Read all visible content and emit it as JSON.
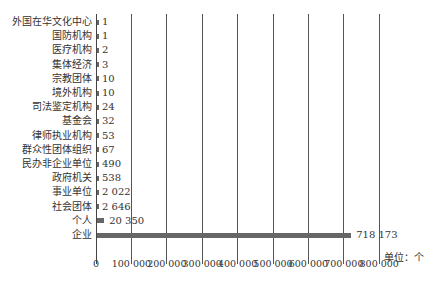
{
  "chart_data": {
    "type": "bar",
    "orientation": "horizontal",
    "title": "",
    "xlabel": "",
    "ylabel": "",
    "unit_label": "单位：个",
    "categories": [
      "外国在华文化中心",
      "国防机构",
      "医疗机构",
      "集体经济",
      "宗教团体",
      "境外机构",
      "司法鉴定机构",
      "基金会",
      "律师执业机构",
      "群众性团体组织",
      "民办非企业单位",
      "政府机关",
      "事业单位",
      "社会团体",
      "个人",
      "企业"
    ],
    "values": [
      1,
      1,
      2,
      3,
      10,
      10,
      24,
      32,
      53,
      67,
      490,
      538,
      2022,
      2646,
      20350,
      718173
    ],
    "value_labels": [
      "1",
      "1",
      "2",
      "3",
      "10",
      "10",
      "24",
      "32",
      "53",
      "67",
      "490",
      "538",
      "2 022",
      "2 646",
      "20 350",
      "718 173"
    ],
    "xlim": [
      0,
      800000
    ],
    "x_ticks": [
      "0",
      "100 000",
      "200 000",
      "300 000",
      "400 000",
      "500 000",
      "600 000",
      "700 000",
      "800 000"
    ],
    "grid": "vertical",
    "legend": null,
    "bar_color": "#666666"
  }
}
